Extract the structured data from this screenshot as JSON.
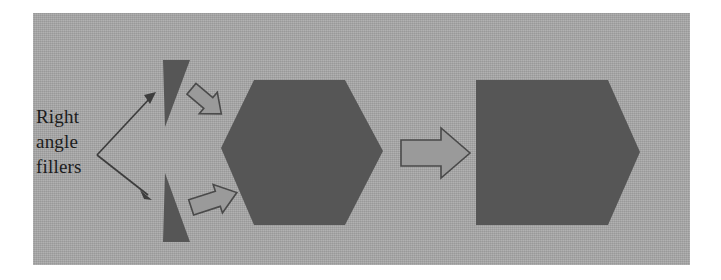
{
  "figure": {
    "kind": "geometry-assembly-diagram",
    "panel_background_color": "#a8a8a8",
    "page_background_color": "#ffffff",
    "label": {
      "lines": [
        "Right",
        "angle",
        "fillers"
      ],
      "full_text": "Right angle fillers",
      "color": "#1c1c1c"
    },
    "shapes": {
      "filler_triangle_top": {
        "name": "right-angle-filler-triangle-top",
        "color": "#565656",
        "points": "163,60 190,60 165,127"
      },
      "filler_triangle_bottom": {
        "name": "right-angle-filler-triangle-bottom",
        "color": "#565656",
        "points": "165,173 190,242 163,242"
      },
      "hexagon": {
        "name": "hexagon-core",
        "color": "#565656",
        "points": "254,80 345,80 383,151 345,225 254,225 221,148"
      },
      "pentagon": {
        "name": "pentagon-result",
        "color": "#565656",
        "points": "476,80 608,80 640,152 608,225 476,225"
      }
    },
    "arrows": {
      "leader_bracket": {
        "name": "leader-double-arrow",
        "color": "#3d3d3d",
        "vertex": [
          97,
          155
        ],
        "tip_upper": [
          156,
          92
        ],
        "tip_lower": [
          151,
          199
        ]
      },
      "filler_arrow_top": {
        "name": "assembly-arrow-top",
        "color": "#9a9a9a",
        "stroke": "#4a4a4a",
        "direction": "down-right"
      },
      "filler_arrow_bottom": {
        "name": "assembly-arrow-bottom",
        "color": "#9a9a9a",
        "stroke": "#4a4a4a",
        "direction": "up-right"
      },
      "transform_arrow": {
        "name": "transform-arrow-right",
        "color": "#9a9a9a",
        "stroke": "#4a4a4a",
        "direction": "right"
      }
    }
  }
}
